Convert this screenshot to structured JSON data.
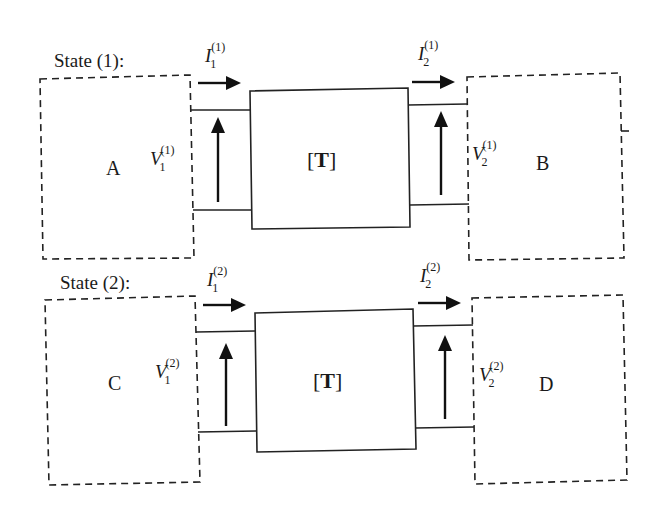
{
  "diagram": {
    "states": [
      {
        "title": "State (1):",
        "left_network": "A",
        "right_network": "B",
        "two_port": {
          "bracket_open": "[",
          "symbol": "T",
          "bracket_close": "]"
        },
        "port1": {
          "current": {
            "sym": "I",
            "sub": "1",
            "sup": "(1)"
          },
          "voltage": {
            "sym": "V",
            "sub": "1",
            "sup": "(1)"
          }
        },
        "port2": {
          "current": {
            "sym": "I",
            "sub": "2",
            "sup": "(1)"
          },
          "voltage": {
            "sym": "V",
            "sub": "2",
            "sup": "(1)"
          }
        }
      },
      {
        "title": "State (2):",
        "left_network": "C",
        "right_network": "D",
        "two_port": {
          "bracket_open": "[",
          "symbol": "T",
          "bracket_close": "]"
        },
        "port1": {
          "current": {
            "sym": "I",
            "sub": "1",
            "sup": "(2)"
          },
          "voltage": {
            "sym": "V",
            "sub": "1",
            "sup": "(2)"
          }
        },
        "port2": {
          "current": {
            "sym": "I",
            "sub": "2",
            "sup": "(2)"
          },
          "voltage": {
            "sym": "V",
            "sub": "2",
            "sup": "(2)"
          }
        }
      }
    ]
  }
}
